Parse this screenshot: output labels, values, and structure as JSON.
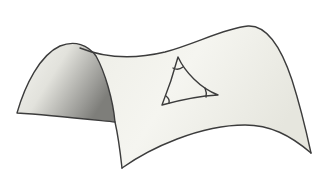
{
  "figure": {
    "colors": {
      "surface_light": "#f4f4ef",
      "surface_mid": "#e6e6df",
      "surface_shadow": "#8c8c8c",
      "outline": "#3c3c3c",
      "background": "#ffffff"
    },
    "triangle": {
      "angle_marks": 3
    }
  }
}
